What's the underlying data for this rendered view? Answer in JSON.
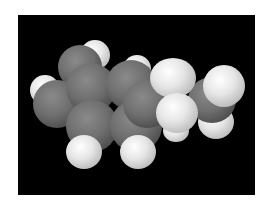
{
  "image": {
    "subject": "space-filling molecular model",
    "background_color": "#000000",
    "frame_color": "#ffffff",
    "atom_colors": {
      "carbon": "#6e6e6e",
      "hydrogen": "#e6e6e6"
    }
  }
}
